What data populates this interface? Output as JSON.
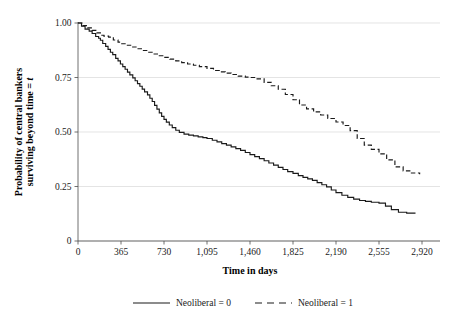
{
  "chart_data": {
    "type": "line",
    "title": "",
    "subtitle": "",
    "xlabel": "Time in days",
    "ylabel": "Probability of central bankers surviving beyond time = t",
    "ylabel_line1": "Probability of central bankers",
    "ylabel_line2_prefix": "surviving beyond time = ",
    "ylabel_line2_italic": "t",
    "xlim": [
      0,
      2920
    ],
    "ylim": [
      0,
      1.0
    ],
    "xticks": [
      0,
      365,
      730,
      1095,
      1460,
      1825,
      2190,
      2555,
      2920
    ],
    "xtick_labels": [
      "0",
      "365",
      "730",
      "1,095",
      "1,460",
      "1,825",
      "2,190",
      "2,555",
      "2,920"
    ],
    "yticks": [
      0,
      0.25,
      0.5,
      0.75,
      1.0
    ],
    "ytick_labels": [
      "0",
      "0.25",
      "0.50",
      "0.75",
      "1.00"
    ],
    "grid": "horizontal",
    "legend_position": "bottom",
    "curve_style": "step",
    "series": [
      {
        "name": "Neoliberal = 0",
        "style": "solid",
        "color": "#1a1a1a",
        "points": [
          [
            0,
            1.0
          ],
          [
            30,
            0.985
          ],
          [
            60,
            0.972
          ],
          [
            95,
            0.963
          ],
          [
            120,
            0.952
          ],
          [
            150,
            0.938
          ],
          [
            175,
            0.93
          ],
          [
            190,
            0.921
          ],
          [
            210,
            0.906
          ],
          [
            235,
            0.893
          ],
          [
            255,
            0.879
          ],
          [
            275,
            0.866
          ],
          [
            295,
            0.855
          ],
          [
            320,
            0.838
          ],
          [
            340,
            0.826
          ],
          [
            360,
            0.812
          ],
          [
            380,
            0.8
          ],
          [
            400,
            0.788
          ],
          [
            420,
            0.775
          ],
          [
            440,
            0.762
          ],
          [
            465,
            0.748
          ],
          [
            485,
            0.735
          ],
          [
            505,
            0.722
          ],
          [
            525,
            0.71
          ],
          [
            545,
            0.697
          ],
          [
            565,
            0.684
          ],
          [
            590,
            0.67
          ],
          [
            610,
            0.655
          ],
          [
            630,
            0.64
          ],
          [
            650,
            0.622
          ],
          [
            670,
            0.605
          ],
          [
            690,
            0.588
          ],
          [
            710,
            0.572
          ],
          [
            730,
            0.558
          ],
          [
            750,
            0.545
          ],
          [
            775,
            0.532
          ],
          [
            800,
            0.52
          ],
          [
            830,
            0.508
          ],
          [
            860,
            0.498
          ],
          [
            900,
            0.49
          ],
          [
            940,
            0.486
          ],
          [
            980,
            0.482
          ],
          [
            1020,
            0.478
          ],
          [
            1060,
            0.474
          ],
          [
            1095,
            0.47
          ],
          [
            1140,
            0.462
          ],
          [
            1180,
            0.455
          ],
          [
            1220,
            0.447
          ],
          [
            1260,
            0.44
          ],
          [
            1300,
            0.432
          ],
          [
            1340,
            0.424
          ],
          [
            1380,
            0.416
          ],
          [
            1420,
            0.406
          ],
          [
            1460,
            0.396
          ],
          [
            1500,
            0.387
          ],
          [
            1540,
            0.378
          ],
          [
            1580,
            0.368
          ],
          [
            1620,
            0.358
          ],
          [
            1660,
            0.348
          ],
          [
            1700,
            0.338
          ],
          [
            1740,
            0.328
          ],
          [
            1780,
            0.318
          ],
          [
            1825,
            0.31
          ],
          [
            1870,
            0.3
          ],
          [
            1910,
            0.292
          ],
          [
            1950,
            0.285
          ],
          [
            1990,
            0.278
          ],
          [
            2030,
            0.268
          ],
          [
            2070,
            0.258
          ],
          [
            2110,
            0.248
          ],
          [
            2150,
            0.234
          ],
          [
            2190,
            0.222
          ],
          [
            2240,
            0.21
          ],
          [
            2290,
            0.2
          ],
          [
            2340,
            0.192
          ],
          [
            2390,
            0.186
          ],
          [
            2440,
            0.182
          ],
          [
            2490,
            0.178
          ],
          [
            2555,
            0.174
          ],
          [
            2610,
            0.16
          ],
          [
            2660,
            0.144
          ],
          [
            2720,
            0.132
          ],
          [
            2790,
            0.128
          ],
          [
            2860,
            0.125
          ]
        ]
      },
      {
        "name": "Neoliberal = 1",
        "style": "dashed",
        "color": "#1a1a1a",
        "points": [
          [
            0,
            1.0
          ],
          [
            40,
            0.988
          ],
          [
            80,
            0.978
          ],
          [
            120,
            0.966
          ],
          [
            160,
            0.955
          ],
          [
            190,
            0.944
          ],
          [
            220,
            0.94
          ],
          [
            260,
            0.935
          ],
          [
            300,
            0.922
          ],
          [
            340,
            0.912
          ],
          [
            365,
            0.905
          ],
          [
            410,
            0.898
          ],
          [
            455,
            0.89
          ],
          [
            500,
            0.882
          ],
          [
            545,
            0.874
          ],
          [
            590,
            0.866
          ],
          [
            640,
            0.858
          ],
          [
            690,
            0.85
          ],
          [
            730,
            0.842
          ],
          [
            780,
            0.834
          ],
          [
            830,
            0.826
          ],
          [
            880,
            0.818
          ],
          [
            930,
            0.812
          ],
          [
            980,
            0.806
          ],
          [
            1030,
            0.8
          ],
          [
            1095,
            0.792
          ],
          [
            1150,
            0.782
          ],
          [
            1200,
            0.776
          ],
          [
            1250,
            0.77
          ],
          [
            1300,
            0.764
          ],
          [
            1360,
            0.756
          ],
          [
            1420,
            0.752
          ],
          [
            1460,
            0.75
          ],
          [
            1520,
            0.744
          ],
          [
            1580,
            0.728
          ],
          [
            1640,
            0.712
          ],
          [
            1700,
            0.696
          ],
          [
            1760,
            0.672
          ],
          [
            1825,
            0.648
          ],
          [
            1880,
            0.624
          ],
          [
            1940,
            0.606
          ],
          [
            2000,
            0.592
          ],
          [
            2060,
            0.578
          ],
          [
            2120,
            0.562
          ],
          [
            2190,
            0.546
          ],
          [
            2250,
            0.53
          ],
          [
            2310,
            0.506
          ],
          [
            2370,
            0.47
          ],
          [
            2430,
            0.44
          ],
          [
            2490,
            0.42
          ],
          [
            2555,
            0.4
          ],
          [
            2620,
            0.372
          ],
          [
            2690,
            0.34
          ],
          [
            2760,
            0.322
          ],
          [
            2830,
            0.312
          ],
          [
            2900,
            0.306
          ]
        ]
      }
    ],
    "legend": [
      {
        "label": "Neoliberal = 0",
        "style": "solid"
      },
      {
        "label": "Neoliberal = 1",
        "style": "dashed"
      }
    ]
  }
}
